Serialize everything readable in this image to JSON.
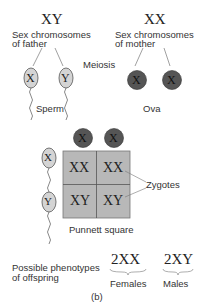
{
  "father": {
    "genotype": "XY",
    "label_line1": "Sex chromosomes",
    "label_line2": "of father"
  },
  "mother": {
    "genotype": "XX",
    "label_line1": "Sex chromosomes",
    "label_line2": "of mother"
  },
  "process": "Meiosis",
  "sperm": {
    "label": "Sperm",
    "alleles": [
      "X",
      "Y"
    ]
  },
  "ova": {
    "label": "Ova",
    "alleles": [
      "X",
      "X"
    ]
  },
  "punnett": {
    "top": [
      "X",
      "X"
    ],
    "side": [
      "X",
      "Y"
    ],
    "cells": [
      [
        "XX",
        "XX"
      ],
      [
        "XY",
        "XY"
      ]
    ],
    "label": "Punnett square",
    "zygotes_label": "Zygotes"
  },
  "phenotypes": {
    "label_line1": "Possible phenotypes",
    "label_line2": "of offspring",
    "female": {
      "count": "2XX",
      "label": "Females"
    },
    "male": {
      "count": "2XY",
      "label": "Males"
    }
  },
  "caption": "(b)",
  "colors": {
    "sperm_fill": "#d4d4d4",
    "ova_fill": "#555555",
    "grid_fill": "#b8b8b8",
    "line": "#666666"
  }
}
